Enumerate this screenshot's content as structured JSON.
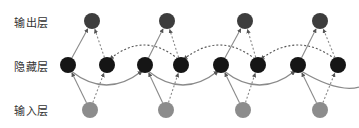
{
  "diagram": {
    "type": "bidirectional-rnn",
    "layers": {
      "output": "输出层",
      "hidden": "隐藏层",
      "input": "输入层"
    },
    "timesteps": 4,
    "colors": {
      "output_node": "#3d3d3d",
      "hidden_node": "#151515",
      "input_node": "#8c8c8c",
      "edge": "#8a8a8a",
      "edge_dark": "#555555"
    },
    "edges": {
      "input_to_forward": "solid",
      "input_to_backward": "dashed",
      "forward_to_output": "solid",
      "backward_to_output": "dashed",
      "forward_recurrent": "solid, left-to-right, below",
      "backward_recurrent": "dashed, right-to-left, above"
    }
  }
}
